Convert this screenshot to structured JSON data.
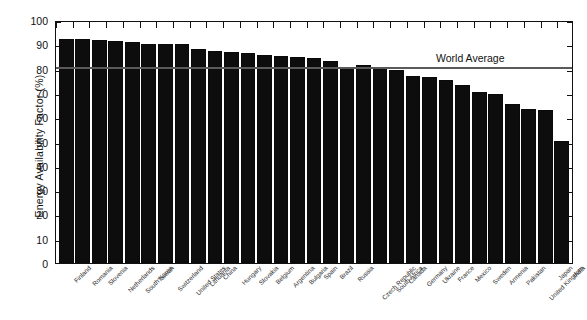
{
  "chart_data": {
    "type": "bar",
    "title": "",
    "xlabel": "",
    "ylabel": "Energy Availability Factor (%)",
    "ylim": [
      0,
      100
    ],
    "yticks": [
      0,
      10,
      20,
      30,
      40,
      50,
      60,
      70,
      80,
      90,
      100
    ],
    "grid": false,
    "legend_position": "none",
    "annotations": [
      {
        "label": "World Average",
        "type": "horizontal-reference-line",
        "value": 80
      }
    ],
    "categories": [
      "Finland",
      "Romania",
      "Slovenia",
      "Netherlands",
      "South Korea",
      "Taiwan",
      "Switzerland",
      "United States",
      "Lithuania",
      "China",
      "Hungary",
      "Slovakia",
      "Belgium",
      "Argentina",
      "Bulgaria",
      "Spain",
      "Brazil",
      "Russia",
      "Czech Republic",
      "South Africa",
      "Canada",
      "Germany",
      "Ukraine",
      "France",
      "Mexico",
      "Sweden",
      "Armenia",
      "Pakistan",
      "United Kingdom",
      "Japan",
      "India"
    ],
    "values": [
      93,
      92.8,
      92.7,
      92,
      91.6,
      91,
      91,
      91,
      89,
      88,
      87.5,
      87,
      86.5,
      86,
      85.5,
      85,
      84,
      81.5,
      82,
      81.5,
      80,
      77.5,
      77,
      76,
      74,
      71,
      70,
      66,
      64,
      63.5,
      50.5
    ]
  },
  "axis": {
    "y_title": "Energy Availability Factor (%)",
    "tick_labels": [
      "100",
      "90",
      "80",
      "70",
      "60",
      "50",
      "40",
      "30",
      "20",
      "10",
      "0"
    ]
  },
  "annotation": {
    "world_average_label": "World Average"
  }
}
